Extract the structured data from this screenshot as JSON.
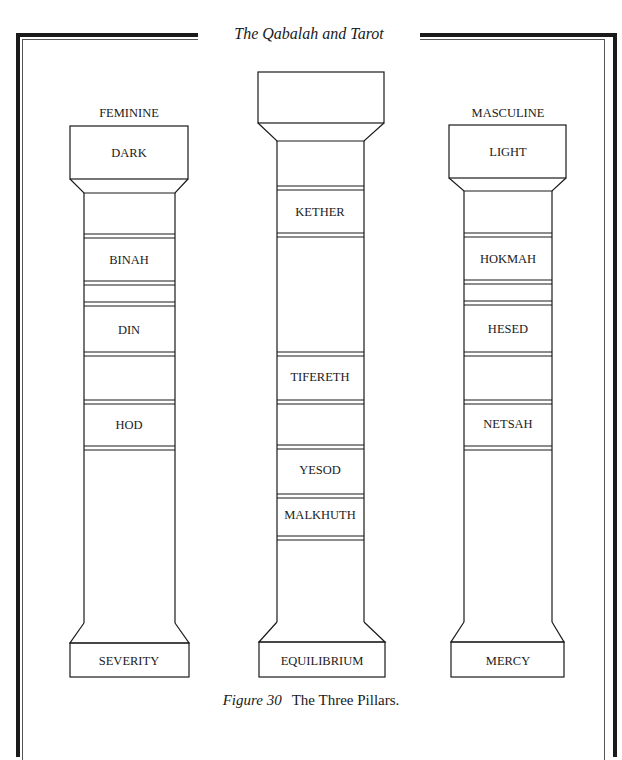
{
  "running_head": "The Qabalah and Tarot",
  "caption": {
    "figure_label": "Figure 30",
    "title": "The Three Pillars."
  },
  "colors": {
    "ink": "#1a1a1a",
    "paper": "#ffffff"
  },
  "pillars": {
    "left": {
      "top_label": "FEMININE",
      "capital": "DARK",
      "sephiroth": [
        "BINAH",
        "DIN",
        "HOD"
      ],
      "base": "SEVERITY"
    },
    "center": {
      "top_label": "",
      "capital": "",
      "sephiroth": [
        "KETHER",
        "TIFERETH",
        "YESOD",
        "MALKHUTH"
      ],
      "base": "EQUILIBRIUM"
    },
    "right": {
      "top_label": "MASCULINE",
      "capital": "LIGHT",
      "sephiroth": [
        "HOKMAH",
        "HESED",
        "NETSAH"
      ],
      "base": "MERCY"
    }
  }
}
